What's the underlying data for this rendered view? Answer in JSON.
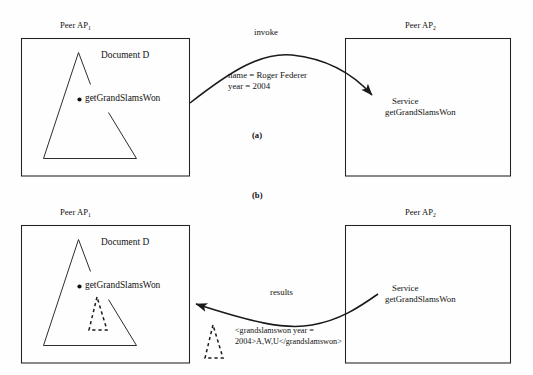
{
  "figure": {
    "panels": [
      {
        "id": "a",
        "label": "(a)"
      },
      {
        "id": "b",
        "label": "(b)"
      }
    ]
  },
  "panel_a": {
    "left_peer": {
      "label_prefix": "Peer AP",
      "label_subscript": "1",
      "document_label": "Document D",
      "node_label": "getGrandSlamsWon"
    },
    "right_peer": {
      "label_prefix": "Peer AP",
      "label_subscript": "2",
      "service_line1": "Service",
      "service_line2": "getGrandSlamsWon"
    },
    "arrow": {
      "label": "invoke",
      "param_line1": "name = Roger Federer",
      "param_line2": "year = 2004",
      "direction": "left-to-right"
    }
  },
  "panel_b": {
    "left_peer": {
      "label_prefix": "Peer AP",
      "label_subscript": "1",
      "document_label": "Document D",
      "node_label": "getGrandSlamsWon"
    },
    "right_peer": {
      "label_prefix": "Peer AP",
      "label_subscript": "2",
      "service_line1": "Service",
      "service_line2": "getGrandSlamsWon"
    },
    "arrow": {
      "label": "results",
      "payload_line1": "<grandslamswon year =",
      "payload_line2": "2004>A,W,U</grandslamswon>",
      "direction": "right-to-left"
    }
  },
  "colors": {
    "ink": "#111111",
    "page": "#fefefe",
    "stroke": "#222222"
  }
}
